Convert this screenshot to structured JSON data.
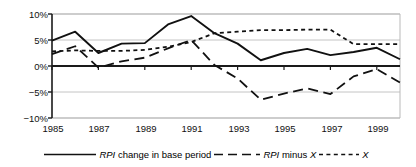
{
  "chart_data": {
    "type": "line",
    "title": "",
    "xlabel": "",
    "ylabel": "",
    "xlim": [
      1985,
      2000
    ],
    "ylim": [
      -10,
      10
    ],
    "yticks": [
      10,
      5,
      0,
      -5,
      -10
    ],
    "ytick_labels": [
      "10%",
      "5%",
      "0%",
      "-5%",
      "-10%"
    ],
    "xticks": [
      1985,
      1987,
      1989,
      1991,
      1993,
      1995,
      1997,
      1999
    ],
    "xtick_labels": [
      "1985",
      "1987",
      "1989",
      "1991",
      "1993",
      "1995",
      "1997",
      "1999"
    ],
    "grid": "horizontal gridlines at 10%, 5%, -5%, -10%; bold zero line at 0%",
    "legend_position": "bottom",
    "x": [
      1985,
      1986,
      1987,
      1988,
      1989,
      1990,
      1991,
      1992,
      1993,
      1994,
      1995,
      1996,
      1997,
      1998,
      1999,
      2000
    ],
    "series": [
      {
        "name": "RPI change in base period",
        "style": "solid",
        "values": [
          4.9,
          6.6,
          2.5,
          4.3,
          4.4,
          8.0,
          9.6,
          6.3,
          4.3,
          1.1,
          2.5,
          3.3,
          2.1,
          2.7,
          3.5,
          1.3
        ]
      },
      {
        "name": "RPI minus X",
        "style": "dashed",
        "values": [
          2.3,
          3.8,
          -0.3,
          0.9,
          1.6,
          3.4,
          5.0,
          0.2,
          -2.4,
          -6.5,
          -5.3,
          -4.3,
          -5.4,
          -2.0,
          -0.6,
          -3.2
        ]
      },
      {
        "name": "X",
        "style": "dotted",
        "values": [
          2.8,
          3.0,
          2.9,
          2.9,
          3.1,
          3.7,
          4.6,
          6.3,
          6.6,
          6.9,
          6.9,
          7.0,
          7.0,
          4.2,
          4.2,
          4.2
        ]
      }
    ]
  },
  "legend": {
    "items": [
      {
        "swatch": "solid-line-swatch",
        "italic_prefix": "RPI",
        "rest": " change in base period"
      },
      {
        "swatch": "dashed-line-swatch",
        "italic_prefix": "RPI",
        "rest": " minus ",
        "italic_suffix": "X"
      },
      {
        "swatch": "dotted-line-swatch",
        "italic_prefix": "",
        "rest": "",
        "italic_suffix": "X"
      }
    ]
  },
  "axes": {
    "y_labels": [
      "10%",
      "5%",
      "0%",
      "−5%",
      "−10%"
    ],
    "x_labels": [
      "1985",
      "1987",
      "1989",
      "1991",
      "1993",
      "1995",
      "1997",
      "1999"
    ]
  }
}
